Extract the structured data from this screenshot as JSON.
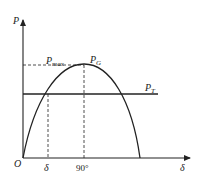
{
  "diagram": {
    "y_axis_label": "P",
    "x_axis_label": "δ",
    "origin_label": "O",
    "curve_peak_label": "P",
    "curve_peak_sub": "G",
    "max_label": "P",
    "max_sub": "max",
    "turbine_label": "P",
    "turbine_sub": "T",
    "operating_angle_label": "δ",
    "peak_angle_label": "90°"
  },
  "colors": {
    "line": "#222222",
    "background": "#ffffff"
  }
}
